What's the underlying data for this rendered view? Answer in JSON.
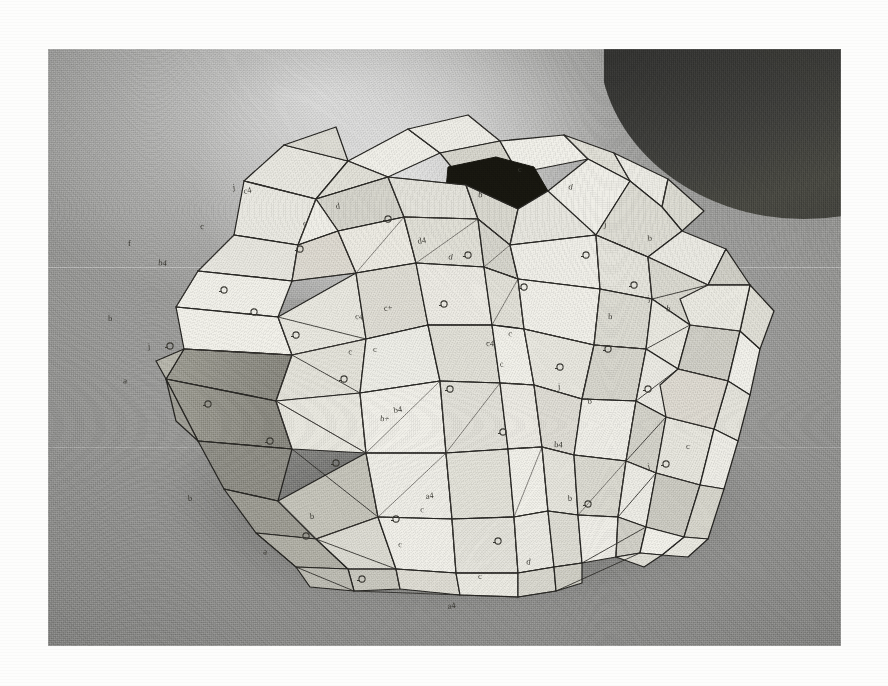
{
  "page": {
    "background_color": "#fdfdfc",
    "type": "photographic-print-on-white-page"
  },
  "photo": {
    "caption": "",
    "x": 48,
    "y": 49,
    "width": 793,
    "height": 597,
    "medium": "black-and-white photograph",
    "subject": "triangulated polyhedral paper model",
    "surface_color": "#9a9a98",
    "dark_corner_color": "#35352f",
    "ink_color": "#262522"
  },
  "model": {
    "description": "Hand-built folded-card geodesic / triangulated polyhedron with a dark open aperture at the crown and two pointed spikes projecting to the left",
    "facet_count_visible": 86,
    "aperture_label": "open aperture",
    "spike_labels": [
      "upper-left spike",
      "lower-left spike"
    ],
    "face_tones": {
      "lightest": "#efefe9",
      "light": "#e4e3dc",
      "mid": "#d2d1c8",
      "mid_dark": "#b9b8ae",
      "dark": "#9b9a90",
      "darkest": "#83827a"
    }
  },
  "annotations": {
    "description": "Pencil construction labels written on the card facets",
    "letters": [
      {
        "text": "c4",
        "x": 196,
        "y": 145
      },
      {
        "text": "c",
        "x": 152,
        "y": 180
      },
      {
        "text": "j",
        "x": 185,
        "y": 141
      },
      {
        "text": "b4",
        "x": 110,
        "y": 216
      },
      {
        "text": "f",
        "x": 80,
        "y": 197
      },
      {
        "text": "d4",
        "x": 370,
        "y": 195
      },
      {
        "text": "c4",
        "x": 307,
        "y": 270
      },
      {
        "text": "c+",
        "x": 336,
        "y": 262
      },
      {
        "text": "c",
        "x": 300,
        "y": 305
      },
      {
        "text": "c",
        "x": 325,
        "y": 303
      },
      {
        "text": "b4",
        "x": 346,
        "y": 364
      },
      {
        "text": "b+",
        "x": 332,
        "y": 372
      },
      {
        "text": "j",
        "x": 100,
        "y": 300
      },
      {
        "text": "a",
        "x": 75,
        "y": 334
      },
      {
        "text": "b",
        "x": 60,
        "y": 272
      },
      {
        "text": "a4",
        "x": 378,
        "y": 450
      },
      {
        "text": "c",
        "x": 372,
        "y": 463
      },
      {
        "text": "b",
        "x": 140,
        "y": 452
      },
      {
        "text": "d",
        "x": 400,
        "y": 210
      },
      {
        "text": "c4",
        "x": 438,
        "y": 297
      },
      {
        "text": "c",
        "x": 452,
        "y": 318
      },
      {
        "text": "c",
        "x": 460,
        "y": 287
      },
      {
        "text": "j",
        "x": 510,
        "y": 340
      },
      {
        "text": "b",
        "x": 540,
        "y": 355
      },
      {
        "text": "b",
        "x": 560,
        "y": 270
      },
      {
        "text": "j",
        "x": 600,
        "y": 252
      },
      {
        "text": "b",
        "x": 618,
        "y": 262
      },
      {
        "text": "c",
        "x": 638,
        "y": 400
      },
      {
        "text": "j",
        "x": 600,
        "y": 420
      },
      {
        "text": "b4",
        "x": 506,
        "y": 398
      },
      {
        "text": "b",
        "x": 520,
        "y": 452
      },
      {
        "text": "d",
        "x": 478,
        "y": 515
      },
      {
        "text": "c",
        "x": 430,
        "y": 530
      },
      {
        "text": "a4",
        "x": 400,
        "y": 560
      },
      {
        "text": "c",
        "x": 350,
        "y": 498
      },
      {
        "text": "b",
        "x": 262,
        "y": 470
      },
      {
        "text": "a",
        "x": 215,
        "y": 505
      },
      {
        "text": "c",
        "x": 255,
        "y": 177
      },
      {
        "text": "d",
        "x": 288,
        "y": 160
      },
      {
        "text": "b",
        "x": 430,
        "y": 148
      },
      {
        "text": "c",
        "x": 470,
        "y": 123
      },
      {
        "text": "d",
        "x": 520,
        "y": 140
      },
      {
        "text": "j",
        "x": 556,
        "y": 178
      },
      {
        "text": "b",
        "x": 600,
        "y": 192
      }
    ],
    "circled_marks": [
      {
        "x": 206,
        "y": 263
      },
      {
        "x": 248,
        "y": 286
      },
      {
        "x": 396,
        "y": 255
      },
      {
        "x": 340,
        "y": 170
      },
      {
        "x": 252,
        "y": 200
      },
      {
        "x": 176,
        "y": 241
      },
      {
        "x": 122,
        "y": 297
      },
      {
        "x": 222,
        "y": 392
      },
      {
        "x": 288,
        "y": 414
      },
      {
        "x": 402,
        "y": 340
      },
      {
        "x": 455,
        "y": 383
      },
      {
        "x": 512,
        "y": 318
      },
      {
        "x": 560,
        "y": 300
      },
      {
        "x": 600,
        "y": 340
      },
      {
        "x": 476,
        "y": 238
      },
      {
        "x": 420,
        "y": 206
      },
      {
        "x": 538,
        "y": 206
      },
      {
        "x": 586,
        "y": 236
      },
      {
        "x": 348,
        "y": 470
      },
      {
        "x": 450,
        "y": 492
      },
      {
        "x": 540,
        "y": 455
      },
      {
        "x": 314,
        "y": 530
      },
      {
        "x": 258,
        "y": 487
      },
      {
        "x": 618,
        "y": 415
      },
      {
        "x": 160,
        "y": 355
      },
      {
        "x": 296,
        "y": 330
      }
    ]
  }
}
